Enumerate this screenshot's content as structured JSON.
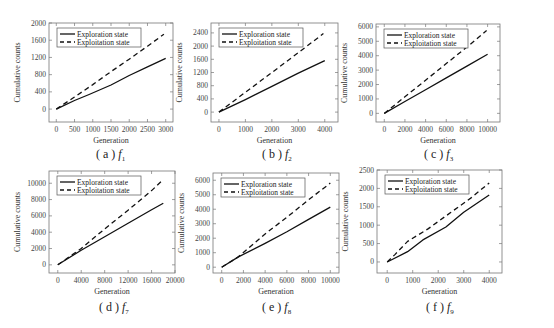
{
  "figure": {
    "panels": [
      {
        "id": "a",
        "caption_label": "( a )",
        "caption_func": "f",
        "caption_sub": "1"
      },
      {
        "id": "b",
        "caption_label": "( b )",
        "caption_func": "f",
        "caption_sub": "2"
      },
      {
        "id": "c",
        "caption_label": "( c )",
        "caption_func": "f",
        "caption_sub": "3"
      },
      {
        "id": "d",
        "caption_label": "( d )",
        "caption_func": "f",
        "caption_sub": "7"
      },
      {
        "id": "e",
        "caption_label": "( e )",
        "caption_func": "f",
        "caption_sub": "8"
      },
      {
        "id": "f",
        "caption_label": "( f )",
        "caption_func": "f",
        "caption_sub": "9"
      }
    ]
  },
  "chart_data": [
    {
      "type": "line",
      "panel": "a",
      "title": "(a) f1",
      "xlabel": "Generation",
      "ylabel": "Cumulative counts",
      "xlim": [
        -200,
        3200
      ],
      "ylim": [
        -300,
        2000
      ],
      "xticks": [
        0,
        500,
        1000,
        1500,
        2000,
        2500,
        3000
      ],
      "yticks": [
        0,
        400,
        800,
        1200,
        1600,
        2000
      ],
      "legend": {
        "position": "upper left",
        "entries": [
          "Exploration state",
          "Exploitation state"
        ]
      },
      "series": [
        {
          "name": "Exploration state",
          "style": "solid",
          "x": [
            0,
            500,
            900,
            1500,
            2000,
            2500,
            3000
          ],
          "y": [
            0,
            200,
            340,
            560,
            780,
            980,
            1180
          ]
        },
        {
          "name": "Exploitation state",
          "style": "dashed",
          "x": [
            0,
            500,
            1000,
            1500,
            2000,
            2500,
            2950
          ],
          "y": [
            0,
            280,
            570,
            870,
            1160,
            1460,
            1740
          ]
        }
      ]
    },
    {
      "type": "line",
      "panel": "b",
      "title": "(b) f2",
      "xlabel": "Generation",
      "ylabel": "Cumulative counts",
      "xlim": [
        -300,
        4500
      ],
      "ylim": [
        -300,
        2700
      ],
      "xticks": [
        0,
        1000,
        2000,
        3000,
        4000
      ],
      "yticks": [
        0,
        400,
        800,
        1200,
        1600,
        2000,
        2400
      ],
      "legend": {
        "position": "upper left",
        "entries": [
          "Exploration state",
          "Exploitation state"
        ]
      },
      "series": [
        {
          "name": "Exploration state",
          "style": "solid",
          "x": [
            0,
            1000,
            2000,
            3000,
            4000
          ],
          "y": [
            0,
            380,
            780,
            1180,
            1560
          ]
        },
        {
          "name": "Exploitation state",
          "style": "dashed",
          "x": [
            0,
            1000,
            2000,
            3000,
            3950
          ],
          "y": [
            0,
            600,
            1200,
            1800,
            2380
          ]
        }
      ]
    },
    {
      "type": "line",
      "panel": "c",
      "title": "(c) f3",
      "xlabel": "Generation",
      "ylabel": "Cumulative counts",
      "xlim": [
        -800,
        11200
      ],
      "ylim": [
        -600,
        6200
      ],
      "xticks": [
        0,
        2000,
        4000,
        6000,
        8000,
        10000
      ],
      "yticks": [
        0,
        1000,
        2000,
        3000,
        4000,
        5000,
        6000
      ],
      "legend": {
        "position": "upper left",
        "entries": [
          "Exploration state",
          "Exploitation state"
        ]
      },
      "series": [
        {
          "name": "Exploration state",
          "style": "solid",
          "x": [
            0,
            2000,
            4000,
            6000,
            8000,
            10000
          ],
          "y": [
            0,
            820,
            1640,
            2460,
            3280,
            4100
          ]
        },
        {
          "name": "Exploitation state",
          "style": "dashed",
          "x": [
            0,
            2000,
            4000,
            6000,
            8000,
            9900
          ],
          "y": [
            0,
            1150,
            2300,
            3450,
            4600,
            5750
          ]
        }
      ]
    },
    {
      "type": "line",
      "panel": "d",
      "title": "(d) f7",
      "xlabel": "Generation",
      "ylabel": "Cumulative counts",
      "xlim": [
        -1500,
        20000
      ],
      "ylim": [
        -1000,
        11500
      ],
      "xticks": [
        0,
        4000,
        8000,
        12000,
        16000,
        20000
      ],
      "yticks": [
        0,
        2000,
        4000,
        6000,
        8000,
        10000
      ],
      "legend": {
        "position": "upper left",
        "entries": [
          "Exploration state",
          "Exploitation state"
        ]
      },
      "series": [
        {
          "name": "Exploration state",
          "style": "solid",
          "x": [
            0,
            4000,
            8000,
            12000,
            16000,
            18000
          ],
          "y": [
            0,
            1800,
            3450,
            5100,
            6750,
            7550
          ]
        },
        {
          "name": "Exploitation state",
          "style": "dashed",
          "x": [
            0,
            4000,
            8000,
            12000,
            16000,
            17900
          ],
          "y": [
            0,
            2000,
            4400,
            6700,
            9100,
            10400
          ]
        }
      ]
    },
    {
      "type": "line",
      "panel": "e",
      "title": "(e) f8",
      "xlabel": "Generation",
      "ylabel": "Cumulative counts",
      "xlim": [
        -800,
        10800
      ],
      "ylim": [
        -400,
        6500
      ],
      "xticks": [
        0,
        2000,
        4000,
        6000,
        8000,
        10000
      ],
      "yticks": [
        0,
        1000,
        2000,
        3000,
        4000,
        5000,
        6000
      ],
      "legend": {
        "position": "upper left",
        "entries": [
          "Exploration state",
          "Exploitation state"
        ]
      },
      "series": [
        {
          "name": "Exploration state",
          "style": "solid",
          "x": [
            0,
            1500,
            4000,
            6000,
            8000,
            10000
          ],
          "y": [
            0,
            700,
            1650,
            2450,
            3300,
            4150
          ]
        },
        {
          "name": "Exploitation state",
          "style": "dashed",
          "x": [
            0,
            1500,
            4000,
            6000,
            8000,
            10000
          ],
          "y": [
            0,
            700,
            2300,
            3450,
            4650,
            5800
          ]
        }
      ]
    },
    {
      "type": "line",
      "panel": "f",
      "title": "(f) f9",
      "xlabel": "Generation",
      "ylabel": "Cumulative counts",
      "xlim": [
        -400,
        4500
      ],
      "ylim": [
        -300,
        2500
      ],
      "xticks": [
        0,
        1000,
        2000,
        3000,
        4000
      ],
      "yticks": [
        0,
        500,
        1000,
        1500,
        2000,
        2500
      ],
      "legend": {
        "position": "upper left",
        "entries": [
          "Exploration state",
          "Exploitation state"
        ]
      },
      "series": [
        {
          "name": "Exploration state",
          "style": "solid",
          "x": [
            0,
            800,
            1400,
            2300,
            3000,
            4000
          ],
          "y": [
            0,
            280,
            600,
            950,
            1350,
            1820
          ]
        },
        {
          "name": "Exploitation state",
          "style": "dashed",
          "x": [
            0,
            300,
            800,
            1600,
            2500,
            3300,
            4000
          ],
          "y": [
            0,
            200,
            560,
            900,
            1350,
            1750,
            2150
          ]
        }
      ]
    }
  ]
}
